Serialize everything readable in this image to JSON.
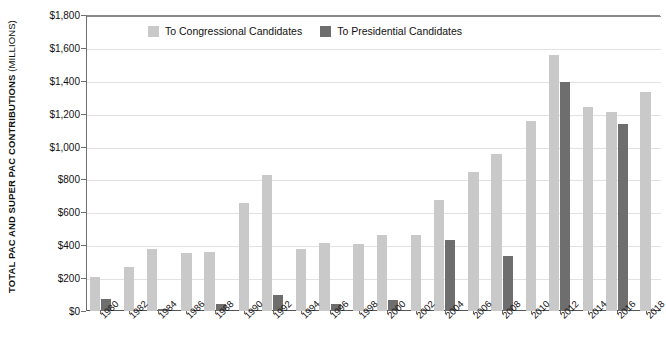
{
  "chart_data": {
    "type": "bar",
    "title": "",
    "subtitle": "",
    "xlabel": "",
    "ylabel": "TOTAL PAC AND SUPER PAC CONTRIBUTIONS",
    "ylabel_units": "(MILLIONS)",
    "grid": true,
    "legend_position": "top-left-inside",
    "ylim": [
      0,
      1800
    ],
    "ytick_step": 200,
    "ytick_labels": [
      "$0",
      "$200",
      "$400",
      "$600",
      "$800",
      "$1,000",
      "$1,200",
      "$1,400",
      "$1,600",
      "$1,800"
    ],
    "ytick_values": [
      0,
      200,
      400,
      600,
      800,
      1000,
      1200,
      1400,
      1600,
      1800
    ],
    "categories": [
      "1980",
      "1982",
      "1984",
      "1986",
      "1988",
      "1990",
      "1992",
      "1994",
      "1996",
      "1998",
      "2000",
      "2002",
      "2004",
      "2006",
      "2008",
      "2010",
      "2012",
      "2014",
      "2016",
      "2018"
    ],
    "series": [
      {
        "name": "To Congressional Candidates",
        "key": "congressional",
        "color": "#c9c9c9",
        "values": [
          205,
          270,
          375,
          350,
          360,
          655,
          825,
          380,
          415,
          405,
          465,
          460,
          675,
          845,
          955,
          1155,
          1555,
          1240,
          1210,
          1330
        ]
      },
      {
        "name": "To Presidential Candidates",
        "key": "presidential",
        "color": "#6e6e6e",
        "values": [
          72,
          0,
          15,
          0,
          40,
          0,
          100,
          0,
          42,
          0,
          68,
          0,
          430,
          0,
          335,
          0,
          1390,
          0,
          1135,
          0
        ]
      }
    ]
  },
  "legend": {
    "items": [
      {
        "label": "To Congressional Candidates",
        "key": "congressional"
      },
      {
        "label": "To Presidential Candidates",
        "key": "presidential"
      }
    ]
  },
  "colors": {
    "congressional": "#c9c9c9",
    "presidential": "#6e6e6e",
    "gridline": "#e2e2e2",
    "axis": "#6f6f6f",
    "text": "#1a1a1a"
  }
}
